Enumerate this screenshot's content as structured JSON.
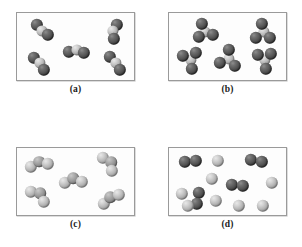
{
  "figure": {
    "width": 302,
    "height": 247,
    "background": "#ffffff",
    "frame_border_color": "#9a9a9a",
    "panel_background": "#fdfdfd",
    "atom_colors": {
      "dark": "#4a4a4a",
      "light": "#c4c4c4",
      "mid": "#999999"
    }
  },
  "panels": [
    {
      "id": "a",
      "caption": "(a)",
      "box": {
        "left": 16,
        "top": 12,
        "width": 119,
        "height": 69
      },
      "caption_top": 84,
      "description": "five bent triatomic molecules, two dark atoms bonded to one light central atom",
      "molecule_count": 5,
      "atoms_per_molecule": 3,
      "composition": "2 dark + 1 light",
      "molecules": [
        {
          "atoms": [
            {
              "type": "dark",
              "cx": 20,
              "cy": 12,
              "r": 6.2
            },
            {
              "type": "light",
              "cx": 25,
              "cy": 17.5,
              "r": 5.6
            },
            {
              "type": "dark",
              "cx": 31,
              "cy": 22,
              "r": 6.2
            }
          ]
        },
        {
          "atoms": [
            {
              "type": "dark",
              "cx": 100,
              "cy": 12,
              "r": 6.2
            },
            {
              "type": "light",
              "cx": 95.5,
              "cy": 18,
              "r": 5.6
            },
            {
              "type": "dark",
              "cx": 97,
              "cy": 25.5,
              "r": 6.2
            }
          ]
        },
        {
          "atoms": [
            {
              "type": "dark",
              "cx": 52,
              "cy": 39,
              "r": 6.2
            },
            {
              "type": "light",
              "cx": 59.5,
              "cy": 36.5,
              "r": 5.6
            },
            {
              "type": "dark",
              "cx": 67,
              "cy": 40,
              "r": 6.2
            }
          ]
        },
        {
          "atoms": [
            {
              "type": "dark",
              "cx": 17,
              "cy": 45,
              "r": 6.2
            },
            {
              "type": "light",
              "cx": 23,
              "cy": 50,
              "r": 5.6
            },
            {
              "type": "dark",
              "cx": 27,
              "cy": 57,
              "r": 6.2
            }
          ]
        },
        {
          "atoms": [
            {
              "type": "dark",
              "cx": 93,
              "cy": 44,
              "r": 6.2
            },
            {
              "type": "light",
              "cx": 99,
              "cy": 49.5,
              "r": 5.6
            },
            {
              "type": "dark",
              "cx": 103,
              "cy": 56.5,
              "r": 6.2
            }
          ]
        }
      ]
    },
    {
      "id": "b",
      "caption": "(b)",
      "box": {
        "left": 168,
        "top": 12,
        "width": 119,
        "height": 69
      },
      "caption_top": 84,
      "description": "five tetrahedral molecules, three dark atoms around one light central atom",
      "molecule_count": 5,
      "atoms_per_molecule": 4,
      "composition": "3 dark + 1 light",
      "molecules": [
        {
          "atoms": [
            {
              "type": "light",
              "cx": 36,
              "cy": 19,
              "r": 5.6
            },
            {
              "type": "dark",
              "cx": 33,
              "cy": 11,
              "r": 6.2
            },
            {
              "type": "dark",
              "cx": 30,
              "cy": 24,
              "r": 6.2
            },
            {
              "type": "dark",
              "cx": 44,
              "cy": 22,
              "r": 6.2
            }
          ]
        },
        {
          "atoms": [
            {
              "type": "light",
              "cx": 95,
              "cy": 19,
              "r": 5.6
            },
            {
              "type": "dark",
              "cx": 93,
              "cy": 11,
              "r": 6.2
            },
            {
              "type": "dark",
              "cx": 87,
              "cy": 25,
              "r": 6.2
            },
            {
              "type": "dark",
              "cx": 101,
              "cy": 25,
              "r": 6.2
            }
          ]
        },
        {
          "atoms": [
            {
              "type": "light",
              "cx": 22,
              "cy": 47,
              "r": 5.6
            },
            {
              "type": "dark",
              "cx": 14,
              "cy": 43,
              "r": 6.2
            },
            {
              "type": "dark",
              "cx": 27,
              "cy": 40,
              "r": 6.2
            },
            {
              "type": "dark",
              "cx": 23,
              "cy": 56,
              "r": 6.2
            }
          ]
        },
        {
          "atoms": [
            {
              "type": "light",
              "cx": 60,
              "cy": 46,
              "r": 5.6
            },
            {
              "type": "dark",
              "cx": 60,
              "cy": 37,
              "r": 6.2
            },
            {
              "type": "dark",
              "cx": 51,
              "cy": 50,
              "r": 6.2
            },
            {
              "type": "dark",
              "cx": 66,
              "cy": 53,
              "r": 6.2
            }
          ]
        },
        {
          "atoms": [
            {
              "type": "light",
              "cx": 96,
              "cy": 47,
              "r": 5.6
            },
            {
              "type": "dark",
              "cx": 89,
              "cy": 42,
              "r": 6.2
            },
            {
              "type": "dark",
              "cx": 102,
              "cy": 41,
              "r": 6.2
            },
            {
              "type": "dark",
              "cx": 97,
              "cy": 56,
              "r": 6.2
            }
          ]
        }
      ]
    },
    {
      "id": "c",
      "caption": "(c)",
      "box": {
        "left": 16,
        "top": 147,
        "width": 119,
        "height": 69
      },
      "caption_top": 219,
      "description": "five bent triatomic molecules, two light atoms bonded to one darker central atom",
      "molecule_count": 5,
      "atoms_per_molecule": 3,
      "composition": "2 light + 1 dark",
      "molecules": [
        {
          "atoms": [
            {
              "type": "light",
              "cx": 14,
              "cy": 19,
              "r": 6.2
            },
            {
              "type": "mid",
              "cx": 22,
              "cy": 13.5,
              "r": 5.8
            },
            {
              "type": "light",
              "cx": 31,
              "cy": 16,
              "r": 6.2
            }
          ]
        },
        {
          "atoms": [
            {
              "type": "light",
              "cx": 86,
              "cy": 10,
              "r": 6.2
            },
            {
              "type": "mid",
              "cx": 94,
              "cy": 14,
              "r": 5.8
            },
            {
              "type": "light",
              "cx": 95,
              "cy": 23,
              "r": 6.2
            }
          ]
        },
        {
          "atoms": [
            {
              "type": "light",
              "cx": 48,
              "cy": 35,
              "r": 6.2
            },
            {
              "type": "mid",
              "cx": 56,
              "cy": 30,
              "r": 5.8
            },
            {
              "type": "light",
              "cx": 65,
              "cy": 34,
              "r": 6.2
            }
          ]
        },
        {
          "atoms": [
            {
              "type": "light",
              "cx": 14,
              "cy": 44,
              "r": 6.2
            },
            {
              "type": "mid",
              "cx": 23,
              "cy": 45,
              "r": 5.8
            },
            {
              "type": "light",
              "cx": 27,
              "cy": 54,
              "r": 6.2
            }
          ]
        },
        {
          "atoms": [
            {
              "type": "light",
              "cx": 87,
              "cy": 56,
              "r": 6.2
            },
            {
              "type": "mid",
              "cx": 93,
              "cy": 49,
              "r": 5.8
            },
            {
              "type": "light",
              "cx": 102,
              "cy": 47,
              "r": 6.2
            }
          ]
        }
      ]
    },
    {
      "id": "d",
      "caption": "(d)",
      "box": {
        "left": 168,
        "top": 147,
        "width": 119,
        "height": 69
      },
      "caption_top": 219,
      "description": "four dark diatomic molecules mixed with eight separate light single atoms",
      "molecule_count": 4,
      "atoms_per_molecule": 2,
      "single_atom_count": 8,
      "composition": "4 dark diatomic pairs + 8 light single atoms",
      "molecules": [
        {
          "atoms": [
            {
              "type": "dark",
              "cx": 16,
              "cy": 14,
              "r": 6.2
            },
            {
              "type": "dark",
              "cx": 27,
              "cy": 13,
              "r": 6.2
            }
          ]
        },
        {
          "atoms": [
            {
              "type": "dark",
              "cx": 82,
              "cy": 12,
              "r": 6.2
            },
            {
              "type": "dark",
              "cx": 93,
              "cy": 14,
              "r": 6.2
            }
          ]
        },
        {
          "atoms": [
            {
              "type": "dark",
              "cx": 63,
              "cy": 37,
              "r": 6.2
            },
            {
              "type": "dark",
              "cx": 74,
              "cy": 38,
              "r": 6.2
            }
          ]
        },
        {
          "atoms": [
            {
              "type": "dark",
              "cx": 30,
              "cy": 45,
              "r": 6.2
            },
            {
              "type": "dark",
              "cx": 28,
              "cy": 56,
              "r": 6.2
            }
          ]
        }
      ],
      "single_atoms": [
        {
          "type": "light",
          "cx": 49,
          "cy": 13,
          "r": 6.2
        },
        {
          "type": "light",
          "cx": 43,
          "cy": 31,
          "r": 6.2
        },
        {
          "type": "light",
          "cx": 103,
          "cy": 35,
          "r": 6.2
        },
        {
          "type": "light",
          "cx": 13,
          "cy": 46,
          "r": 6.2
        },
        {
          "type": "light",
          "cx": 47,
          "cy": 53,
          "r": 6.2
        },
        {
          "type": "light",
          "cx": 70,
          "cy": 58,
          "r": 6.2
        },
        {
          "type": "light",
          "cx": 94,
          "cy": 58,
          "r": 6.2
        },
        {
          "type": "light",
          "cx": 19,
          "cy": 58,
          "r": 6.2
        }
      ]
    }
  ]
}
